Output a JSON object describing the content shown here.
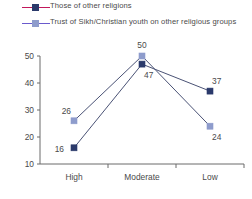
{
  "legend": {
    "entries": [
      {
        "label": "Those of other religions",
        "line_color": "#c2185b",
        "marker_color": "#2b3a6b",
        "marker_name": "legend-marker-other-religions"
      },
      {
        "label": "Trust of Sikh/Christian youth on other religious groups",
        "line_color": "#6a5acd",
        "marker_color": "#8e9ccc",
        "marker_name": "legend-marker-trust-sikh-christian"
      }
    ]
  },
  "chart_data": {
    "type": "line",
    "title": "",
    "subtitle": "",
    "xlabel": "",
    "ylabel": "",
    "categories": [
      "High",
      "Moderate",
      "Low"
    ],
    "ylim": [
      10,
      50
    ],
    "yticks": [
      10,
      20,
      30,
      40,
      50
    ],
    "ytick_labels": [
      "10",
      "20",
      "30",
      "40",
      "50"
    ],
    "grid": false,
    "legend_position": "top-left",
    "line_color": "#4a5275",
    "series": [
      {
        "name": "Those of other religions",
        "values": [
          16,
          47,
          37
        ],
        "labels": [
          "16",
          "47",
          "37"
        ],
        "marker_color": "#2b3a6b",
        "marker_shape": "square"
      },
      {
        "name": "Trust of Sikh/Christian youth on other religious groups",
        "values": [
          26,
          50,
          24
        ],
        "labels": [
          "26",
          "50",
          "24"
        ],
        "marker_color": "#8e9ccc",
        "marker_shape": "square"
      }
    ]
  }
}
